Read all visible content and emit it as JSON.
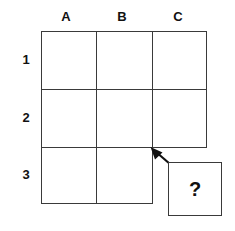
{
  "figure": {
    "type": "grid-puzzle",
    "background_color": "#ffffff",
    "line_color": "#3a3a3a",
    "text_color": "#111111"
  },
  "grid": {
    "columns": [
      "A",
      "B",
      "C"
    ],
    "rows": [
      "1",
      "2",
      "3"
    ],
    "cells": [
      {
        "id": "A1",
        "column": "A",
        "row": "1",
        "value": "",
        "present": true
      },
      {
        "id": "B1",
        "column": "B",
        "row": "1",
        "value": "",
        "present": true
      },
      {
        "id": "C1",
        "column": "C",
        "row": "1",
        "value": "",
        "present": true
      },
      {
        "id": "A2",
        "column": "A",
        "row": "2",
        "value": "",
        "present": true
      },
      {
        "id": "B2",
        "column": "B",
        "row": "2",
        "value": "",
        "present": true
      },
      {
        "id": "C2",
        "column": "C",
        "row": "2",
        "value": "",
        "present": true
      },
      {
        "id": "A3",
        "column": "A",
        "row": "3",
        "value": "",
        "present": true
      },
      {
        "id": "B3",
        "column": "B",
        "row": "3",
        "value": "",
        "present": true
      },
      {
        "id": "C3",
        "column": "C",
        "row": "3",
        "value": "",
        "present": false
      }
    ]
  },
  "answer_cell": {
    "label": "?",
    "target_cell": "C3"
  },
  "arrow": {
    "name": "arrow-to-missing-cell",
    "points_from": "answer-cell",
    "points_to": "C3"
  }
}
